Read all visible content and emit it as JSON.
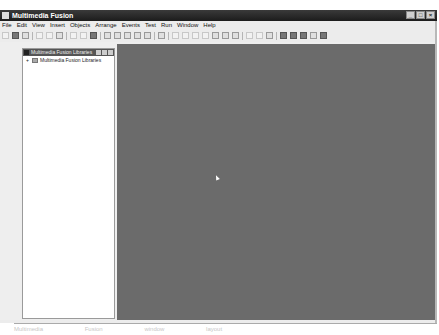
{
  "window": {
    "title": "Multimedia Fusion",
    "controls": {
      "minimize": "_",
      "maximize": "□",
      "close": "×"
    }
  },
  "menubar": {
    "items": [
      "File",
      "Edit",
      "View",
      "Insert",
      "Objects",
      "Arrange",
      "Events",
      "Test",
      "Run",
      "Window",
      "Help"
    ]
  },
  "toolbar": {
    "buttons": [
      "new-icon",
      "open-icon",
      "save-icon",
      "cut-icon",
      "copy-icon",
      "paste-icon",
      "undo-icon",
      "redo-icon",
      "help-icon",
      "frame-editor-icon",
      "storyboard-icon",
      "event-editor-icon",
      "event-list-icon",
      "step-through-icon",
      "lock-icon",
      "align-icon",
      "distribute-icon",
      "size-icon",
      "grid-icon",
      "zoom-icon",
      "library-icon",
      "properties-icon",
      "layers-icon",
      "rewind-icon",
      "stop-icon",
      "pause-icon",
      "step-icon",
      "play-icon"
    ]
  },
  "library_panel": {
    "title": "Multimedia Fusion Libraries",
    "tree": [
      {
        "expander": "+",
        "label": "Multimedia Fusion Libraries"
      }
    ]
  },
  "caption": {
    "parts": [
      "Multimedia",
      "Fusion",
      "window",
      "layout"
    ]
  }
}
